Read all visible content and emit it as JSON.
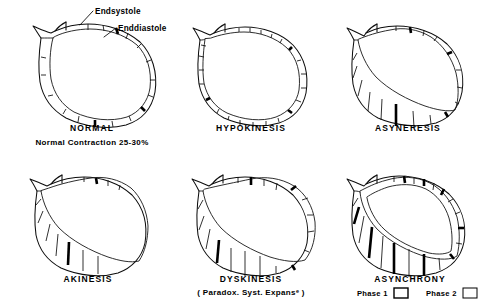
{
  "figure": {
    "background_color": "#ffffff",
    "ink_color": "#000000",
    "title": "",
    "kind": "line-drawing"
  },
  "callouts": [
    {
      "id": "endsystole",
      "label": "Endsystole"
    },
    {
      "id": "enddiastole",
      "label": "Enddiastole"
    }
  ],
  "panels": [
    {
      "id": "normal",
      "title": "NORMAL",
      "subtitle": "Normal Contraction 25-30%",
      "row": 1,
      "column": 1
    },
    {
      "id": "hypokinesis",
      "title": "HYPOKINESIS",
      "subtitle": "",
      "row": 1,
      "column": 2
    },
    {
      "id": "asyneresis",
      "title": "ASYNERESIS",
      "subtitle": "",
      "row": 1,
      "column": 3
    },
    {
      "id": "akinesis",
      "title": "AKINESIS",
      "subtitle": "",
      "row": 2,
      "column": 1
    },
    {
      "id": "dyskinesis",
      "title": "DYSKINESIS",
      "subtitle": "( Paradox. Syst. Expansᵉ )",
      "row": 2,
      "column": 2
    },
    {
      "id": "asynchrony",
      "title": "ASYNCHRONY",
      "subtitle": "",
      "row": 2,
      "column": 3
    }
  ],
  "legend": {
    "items": [
      {
        "id": "phase-1",
        "label": "Phase 1",
        "swatch": "open-rectangle"
      },
      {
        "id": "phase-2",
        "label": "Phase 2",
        "swatch": "open-rectangle"
      }
    ]
  }
}
